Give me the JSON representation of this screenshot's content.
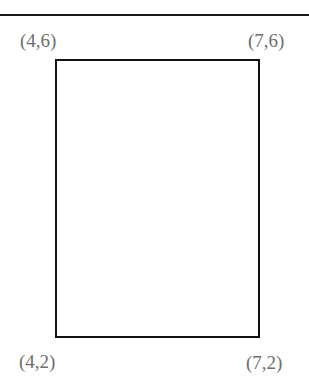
{
  "diagram": {
    "type": "rectangle-with-vertex-coordinates",
    "vertices": {
      "top_left": "(4,6)",
      "top_right": "(7,6)",
      "bottom_left": "(4,2)",
      "bottom_right": "(7,2)"
    },
    "colors": {
      "stroke": "#111111",
      "label": "#6e6e6e",
      "background": "#ffffff"
    }
  }
}
